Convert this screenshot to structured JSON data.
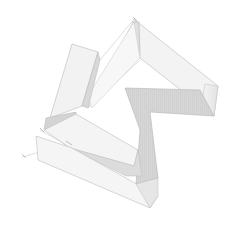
{
  "image": {
    "subject": "pencil sketch of folded ribbon",
    "background": "#ffffff",
    "colors": {
      "light_face": "#f2f2f2",
      "mid_face": "#e4e4e4",
      "dark_face": "#cfcfcf",
      "stroke": "#b8b8b8"
    }
  }
}
